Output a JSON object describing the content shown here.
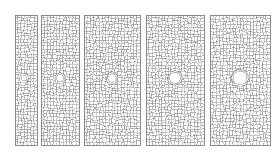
{
  "figure": {
    "title": "",
    "background_color": "#ffffff",
    "width": 279,
    "height": 153,
    "mesh_line_color": "#808080",
    "panel_border_color": "#707070",
    "hole_fill_color": "#ffffff",
    "cell_fill_color": "#ffffff"
  },
  "chart_data": {
    "type": "diagram",
    "title": "",
    "xlabel": "",
    "ylabel": "",
    "panel_count": 5,
    "categories": [
      "Panel 1",
      "Panel 2",
      "Panel 3",
      "Panel 4",
      "Panel 5"
    ],
    "values": [
      6,
      7,
      8,
      11,
      13
    ],
    "series": [
      {
        "name": "hole_diameter_px",
        "values": [
          6,
          7,
          8,
          11,
          13
        ]
      },
      {
        "name": "panel_width_px",
        "values": [
          22,
          38,
          55,
          57,
          60
        ]
      },
      {
        "name": "panel_height_px",
        "values": [
          130,
          130,
          130,
          130,
          130
        ]
      }
    ],
    "panels": [
      {
        "label": "Panel 1",
        "x": 15,
        "y": 15,
        "width": 22,
        "height": 130,
        "hole_cx": 24,
        "hole_cy": 78,
        "hole_r": 3.0,
        "cell_size": 3.0
      },
      {
        "label": "Panel 2",
        "x": 41,
        "y": 15,
        "width": 38,
        "height": 130,
        "hole_cx": 60,
        "hole_cy": 78,
        "hole_r": 3.6,
        "cell_size": 3.1
      },
      {
        "label": "Panel 3",
        "x": 84,
        "y": 15,
        "width": 56,
        "height": 130,
        "hole_cx": 112,
        "hole_cy": 78,
        "hole_r": 4.2,
        "cell_size": 3.2
      },
      {
        "label": "Panel 4",
        "x": 146,
        "y": 15,
        "width": 58,
        "height": 130,
        "hole_cx": 175,
        "hole_cy": 78,
        "hole_r": 5.5,
        "cell_size": 3.2
      },
      {
        "label": "Panel 5",
        "x": 210,
        "y": 15,
        "width": 60,
        "height": 130,
        "hole_cx": 240,
        "hole_cy": 78,
        "hole_r": 6.8,
        "cell_size": 3.3
      }
    ],
    "grid": false,
    "legend": "none"
  }
}
